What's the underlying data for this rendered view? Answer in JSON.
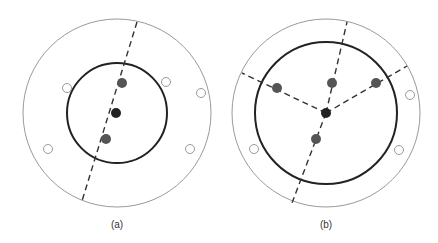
{
  "figure": {
    "colors": {
      "outer_circle": "#9a9a9a",
      "inner_circle": "#222222",
      "dashed_line": "#333333",
      "filled_dot": "#555555",
      "center_dot": "#222222",
      "open_dot": "#9a9a9a"
    },
    "panels": [
      {
        "label": "(a)",
        "outer_circle": {
          "cx": 117,
          "cy": 113,
          "r": 94
        },
        "inner_circle": {
          "cx": 117,
          "cy": 113,
          "r": 50
        },
        "dashed_lines": [
          {
            "x1": 137,
            "y1": 22,
            "x2": 82,
            "y2": 201
          }
        ],
        "center_dot": {
          "cx": 116,
          "cy": 113
        },
        "filled_dots": [
          {
            "cx": 122,
            "cy": 83
          },
          {
            "cx": 106,
            "cy": 139
          }
        ],
        "open_dots": [
          {
            "cx": 67,
            "cy": 88
          },
          {
            "cx": 166,
            "cy": 82
          },
          {
            "cx": 201,
            "cy": 93
          },
          {
            "cx": 48,
            "cy": 149
          },
          {
            "cx": 190,
            "cy": 149
          }
        ]
      },
      {
        "label": "(b)",
        "outer_circle": {
          "cx": 326,
          "cy": 113,
          "r": 94
        },
        "inner_circle": {
          "cx": 326,
          "cy": 113,
          "r": 71
        },
        "dashed_lines": [
          {
            "x1": 326,
            "y1": 113,
            "x2": 347,
            "y2": 22
          },
          {
            "x1": 326,
            "y1": 113,
            "x2": 292,
            "y2": 203
          },
          {
            "x1": 326,
            "y1": 113,
            "x2": 242,
            "y2": 73
          },
          {
            "x1": 326,
            "y1": 113,
            "x2": 407,
            "y2": 66
          }
        ],
        "center_dot": {
          "cx": 326,
          "cy": 113
        },
        "filled_dots": [
          {
            "cx": 277,
            "cy": 88
          },
          {
            "cx": 332,
            "cy": 83
          },
          {
            "cx": 376,
            "cy": 83
          },
          {
            "cx": 316,
            "cy": 139
          }
        ],
        "open_dots": [
          {
            "cx": 410,
            "cy": 95
          },
          {
            "cx": 254,
            "cy": 149
          },
          {
            "cx": 399,
            "cy": 150
          }
        ]
      }
    ]
  }
}
